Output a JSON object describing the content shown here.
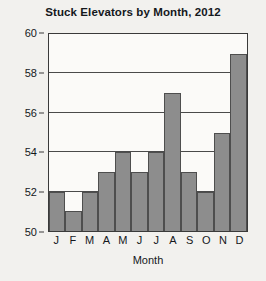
{
  "chart_data": {
    "type": "bar",
    "title": "Stuck Elevators by Month, 2012",
    "xlabel": "Month",
    "ylabel": "",
    "categories": [
      "J",
      "F",
      "M",
      "A",
      "M",
      "J",
      "J",
      "A",
      "S",
      "O",
      "N",
      "D"
    ],
    "values": [
      52,
      51,
      52,
      53,
      54,
      53,
      54,
      57,
      53,
      52,
      55,
      59
    ],
    "ylim": [
      50,
      60
    ],
    "yticks": [
      50,
      52,
      54,
      56,
      58,
      60
    ],
    "ytick_labels": [
      "50",
      "52",
      "54",
      "56",
      "58",
      "60"
    ],
    "gridlines": [
      52,
      54,
      56,
      58
    ],
    "grid": true,
    "legend": null,
    "bar_color": "#8d8d8d",
    "bar_edge_color": "#4e4e4e",
    "axis_color": "#3a3a3a",
    "background_color": "#f2f1ee",
    "plot_background_color": "#fbfaf8",
    "text_color": "#15181c"
  }
}
